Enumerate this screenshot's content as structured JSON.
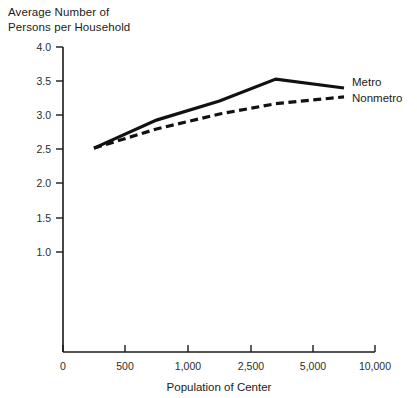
{
  "chart_data": {
    "type": "line",
    "title": "",
    "ylabel": "Average Number of\nPersons per Household",
    "xlabel": "Population of Center",
    "categories": [
      "0",
      "500",
      "1,000",
      "2,500",
      "5,000",
      "10,000"
    ],
    "x_tick_labels": [
      "0",
      "500",
      "1,000",
      "2,500",
      "5,000",
      "10,000"
    ],
    "y_tick_labels": [
      "1.0",
      "1.5",
      "2.0",
      "2.5",
      "3.0",
      "3.5",
      "4.0"
    ],
    "y_tick_values": [
      1.0,
      1.5,
      2.0,
      2.5,
      3.0,
      3.5,
      4.0
    ],
    "ylim": [
      0.0,
      4.0
    ],
    "grid": false,
    "legend_position": "right-inline",
    "series": [
      {
        "name": "Metro",
        "style": "solid",
        "color": "#111111",
        "x": [
          250,
          750,
          1750,
          3500,
          7500
        ],
        "values": [
          2.52,
          2.93,
          3.21,
          3.53,
          3.4
        ]
      },
      {
        "name": "Nonmetro",
        "style": "dashed",
        "color": "#111111",
        "x": [
          250,
          750,
          1750,
          3500,
          7500
        ],
        "values": [
          2.52,
          2.8,
          3.02,
          3.17,
          3.27
        ]
      }
    ],
    "annotations": [
      {
        "text": "Metro",
        "at": "end-of-solid-line"
      },
      {
        "text": "Nonmetro",
        "at": "end-of-dashed-line"
      }
    ]
  },
  "axes": {
    "y_title_line1": "Average Number of",
    "y_title_line2": "Persons per Household",
    "x_title": "Population of Center"
  }
}
